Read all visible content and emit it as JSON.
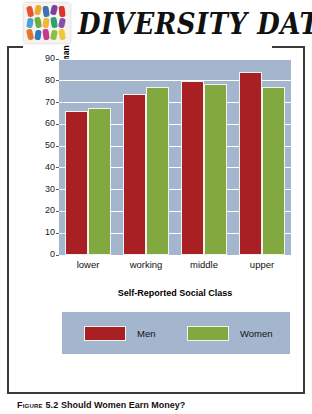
{
  "header": {
    "wordmark": "DIVERSITY DATA",
    "logo_name": "confetti-mosaic-logo"
  },
  "chart_data": {
    "type": "bar",
    "title": "",
    "categories": [
      "lower",
      "working",
      "middle",
      "upper"
    ],
    "series": [
      {
        "name": "Men",
        "color": "#a81f24",
        "values": [
          66,
          74,
          80,
          84
        ]
      },
      {
        "name": "Women",
        "color": "#82a93f",
        "values": [
          67.5,
          77,
          78.5,
          77
        ]
      }
    ],
    "xlabel": "Self-Reported Social Class",
    "ylabel": "Percent Approving of a Married Woman Earning Money",
    "ylim": [
      0,
      90
    ],
    "yticks": [
      0,
      10,
      20,
      30,
      40,
      50,
      60,
      70,
      80,
      90
    ],
    "ytick_labels": [
      "0",
      "10",
      "20",
      "30",
      "40",
      "50",
      "60",
      "70",
      "80",
      "90"
    ],
    "grid": true,
    "legend_position": "bottom",
    "plot_background": "#a3b6cd"
  },
  "caption": {
    "label": "Figure 5.2",
    "text": "Should Women Earn Money?"
  }
}
